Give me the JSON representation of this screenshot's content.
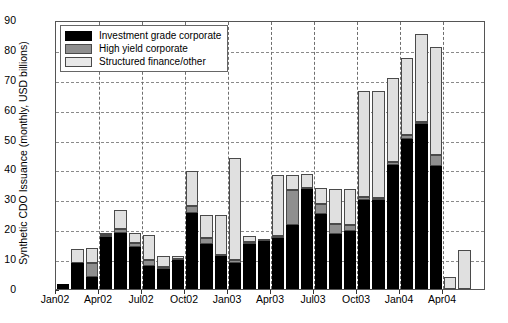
{
  "chart_data": {
    "type": "bar",
    "stacked": true,
    "title": "",
    "xlabel": "",
    "ylabel": "Synthetic CDO Issuance (monthly, USD billions)",
    "ylim": [
      0,
      90
    ],
    "ytick_labels": [
      "0",
      "10",
      "20",
      "30",
      "40",
      "50",
      "60",
      "70",
      "80",
      "90"
    ],
    "ytick_values": [
      0,
      10,
      20,
      30,
      40,
      50,
      60,
      70,
      80,
      90
    ],
    "grid": true,
    "legend_position": "upper left",
    "categories": [
      "Jan02",
      "Feb02",
      "Mar02",
      "Apr02",
      "May02",
      "Jun02",
      "Jul02",
      "Aug02",
      "Sep02",
      "Oct02",
      "Nov02",
      "Dec02",
      "Jan03",
      "Feb03",
      "Mar03",
      "Apr03",
      "May03",
      "Jun03",
      "Jul03",
      "Aug03",
      "Sep03",
      "Oct03",
      "Nov03",
      "Dec03",
      "Jan04",
      "Feb04",
      "Mar04"
    ],
    "xtick_labels": [
      "Jan02",
      "Apr02",
      "Jul02",
      "Oct02",
      "Jan03",
      "Apr03",
      "Jul03",
      "Oct03",
      "Jan04",
      "Apr04"
    ],
    "xtick_categories": [
      "Jan02",
      "Apr02",
      "Jul02",
      "Oct02",
      "Jan03",
      "Apr03",
      "Jul03",
      "Oct03",
      "Jan04",
      "Apr04"
    ],
    "series": [
      {
        "name": "Investment grade corporate",
        "color": "#000000",
        "values": [
          1.8,
          8.6,
          4.0,
          17.3,
          18.9,
          14.2,
          7.7,
          6.8,
          9.8,
          25.4,
          14.9,
          11.0,
          8.6,
          15.0,
          15.9,
          17.0,
          21.5,
          33.3,
          25.2,
          18.5,
          19.5,
          29.8,
          29.9,
          41.6,
          50.2,
          55.2,
          41.2
        ]
      },
      {
        "name": "High yield corporate",
        "color": "#8f8f8f",
        "values": [
          0.0,
          0.2,
          4.8,
          0.9,
          1.1,
          1.2,
          2.1,
          0.4,
          0.3,
          2.3,
          2.2,
          0.3,
          1.2,
          0.6,
          0.1,
          0.6,
          11.7,
          0.6,
          3.4,
          3.1,
          1.8,
          1.0,
          0.5,
          0.8,
          1.3,
          0.6,
          3.5
        ]
      },
      {
        "name": "Structured finance/other",
        "color": "#e0e0e0",
        "values": [
          0.0,
          4.7,
          5.0,
          0.3,
          6.6,
          3.4,
          8.2,
          3.8,
          0.9,
          11.8,
          7.7,
          13.6,
          34.1,
          2.1,
          0.0,
          20.7,
          5.0,
          4.6,
          5.2,
          11.7,
          12.1,
          35.5,
          36.0,
          28.3,
          25.8,
          29.6,
          36.3
        ]
      }
    ],
    "totals": [
      1.8,
      13.5,
      13.8,
      18.5,
      26.6,
      18.8,
      18.0,
      11.0,
      11.0,
      39.5,
      24.8,
      24.9,
      43.9,
      17.7,
      16.0,
      38.3,
      38.2,
      38.5,
      33.8,
      33.3,
      33.4,
      66.3,
      66.4,
      70.7,
      77.3,
      85.4,
      81.0
    ],
    "trailing_bars": [
      {
        "category": "Apr04-pre1",
        "label": "",
        "investment_grade": 0.0,
        "high_yield": 0.0,
        "structured": 4.0
      },
      {
        "category": "Apr04-pre2",
        "label": "",
        "investment_grade": 0.0,
        "high_yield": 0.0,
        "structured": 13.0
      }
    ]
  },
  "legend": {
    "items": [
      {
        "label": "Investment grade corporate",
        "swatch": "investment-grade-swatch"
      },
      {
        "label": "High yield corporate",
        "swatch": "high-yield-swatch"
      },
      {
        "label": "Structured finance/other",
        "swatch": "structured-finance-swatch"
      }
    ]
  },
  "axes": {
    "y_title": "Synthetic CDO Issuance (monthly, USD billions)"
  }
}
